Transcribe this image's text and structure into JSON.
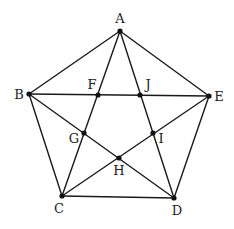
{
  "diagram": {
    "type": "pentagon with inscribed pentagram",
    "colors": {
      "line": "#1a1a1a",
      "point": "#111111",
      "label": "#222222",
      "background": "#ffffff"
    },
    "points": [
      {
        "id": "A",
        "label": "A",
        "x": 120,
        "y": 31,
        "lx": 120,
        "ly": 23,
        "anchor": "middle"
      },
      {
        "id": "B",
        "label": "B",
        "x": 29,
        "y": 94,
        "lx": 19,
        "ly": 99,
        "anchor": "middle"
      },
      {
        "id": "E",
        "label": "E",
        "x": 209,
        "y": 96,
        "lx": 219,
        "ly": 101,
        "anchor": "middle"
      },
      {
        "id": "C",
        "label": "C",
        "x": 62,
        "y": 196,
        "lx": 59,
        "ly": 213,
        "anchor": "middle"
      },
      {
        "id": "D",
        "label": "D",
        "x": 174,
        "y": 198,
        "lx": 177,
        "ly": 215,
        "anchor": "middle"
      },
      {
        "id": "F",
        "label": "F",
        "x": 98,
        "y": 95,
        "lx": 92,
        "ly": 89,
        "anchor": "middle"
      },
      {
        "id": "J",
        "label": "J",
        "x": 140,
        "y": 95,
        "lx": 148,
        "ly": 89,
        "anchor": "middle"
      },
      {
        "id": "G",
        "label": "G",
        "x": 84,
        "y": 133,
        "lx": 74,
        "ly": 143,
        "anchor": "middle"
      },
      {
        "id": "I",
        "label": "I",
        "x": 153,
        "y": 133,
        "lx": 161,
        "ly": 143,
        "anchor": "middle"
      },
      {
        "id": "H",
        "label": "H",
        "x": 119,
        "y": 158,
        "lx": 119,
        "ly": 175,
        "anchor": "middle"
      }
    ],
    "edges": [
      [
        "A",
        "B"
      ],
      [
        "A",
        "E"
      ],
      [
        "B",
        "C"
      ],
      [
        "E",
        "D"
      ],
      [
        "C",
        "D"
      ],
      [
        "A",
        "C"
      ],
      [
        "A",
        "D"
      ],
      [
        "B",
        "E"
      ],
      [
        "B",
        "D"
      ],
      [
        "E",
        "C"
      ]
    ]
  }
}
